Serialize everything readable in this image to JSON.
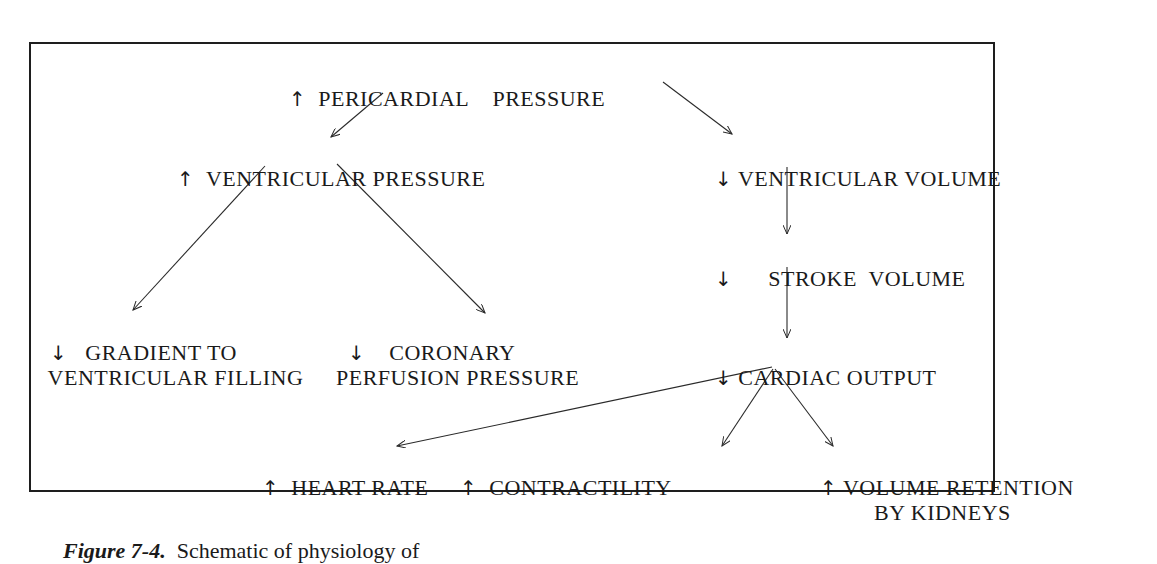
{
  "diagram": {
    "nodes": {
      "pericardial_pressure": {
        "arrow": "↑",
        "text": "PERICARDIAL    PRESSURE"
      },
      "ventricular_pressure": {
        "arrow": "↑",
        "text": "VENTRICULAR PRESSURE"
      },
      "ventricular_volume": {
        "arrow": "↓",
        "text": "VENTRICULAR VOLUME"
      },
      "stroke_volume": {
        "arrow": "↓",
        "text": "STROKE  VOLUME"
      },
      "gradient_filling": {
        "arrow": "↓",
        "line1": "GRADIENT TO",
        "line2": "VENTRICULAR FILLING"
      },
      "coronary_perfusion": {
        "arrow": "↓",
        "line1": "CORONARY",
        "line2": "PERFUSION PRESSURE"
      },
      "cardiac_output": {
        "arrow": "↓",
        "text": "CARDIAC OUTPUT"
      },
      "heart_rate": {
        "arrow": "↑",
        "text": "HEART RATE"
      },
      "contractility": {
        "arrow": "↑",
        "text": "CONTRACTILITY"
      },
      "volume_retention": {
        "arrow": "↑",
        "line1": "VOLUME RETENTION",
        "line2": "BY KIDNEYS"
      }
    },
    "edges": [
      [
        "pericardial_pressure",
        "ventricular_pressure"
      ],
      [
        "pericardial_pressure",
        "ventricular_volume"
      ],
      [
        "ventricular_pressure",
        "gradient_filling"
      ],
      [
        "ventricular_pressure",
        "coronary_perfusion"
      ],
      [
        "ventricular_volume",
        "stroke_volume"
      ],
      [
        "stroke_volume",
        "cardiac_output"
      ],
      [
        "cardiac_output",
        "heart_rate"
      ],
      [
        "cardiac_output",
        "contractility"
      ],
      [
        "cardiac_output",
        "volume_retention"
      ]
    ]
  },
  "caption": {
    "figure": "Figure 7-4.",
    "text": "Schematic of physiology of"
  }
}
